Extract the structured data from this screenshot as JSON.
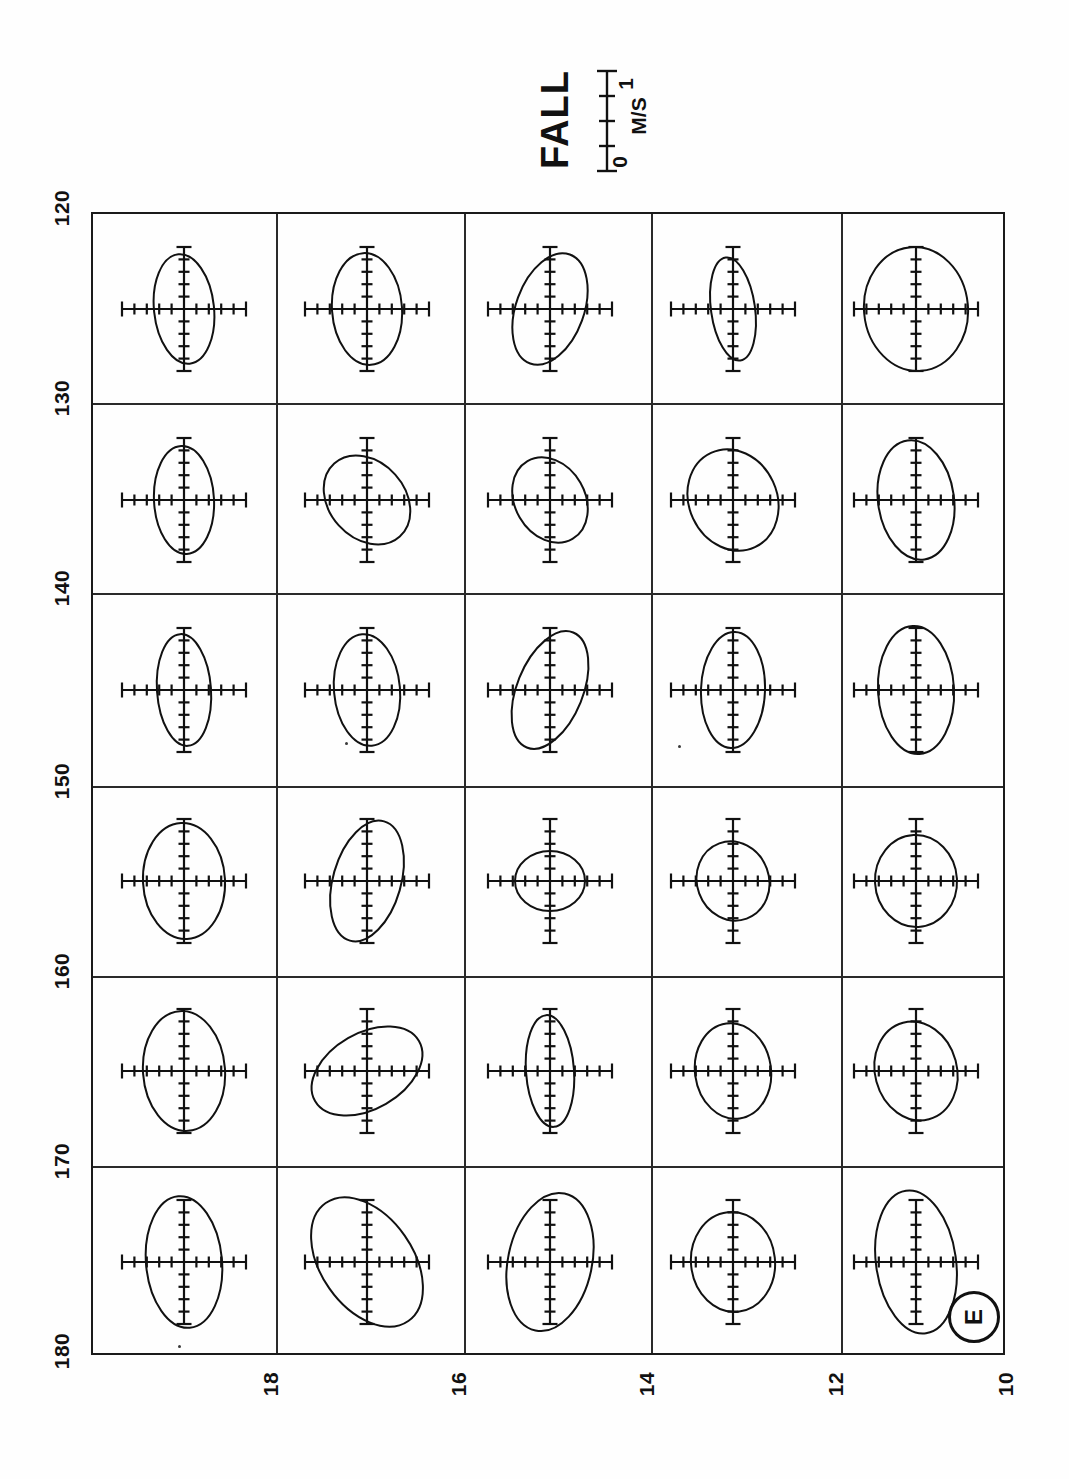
{
  "figure": {
    "title": "FALL",
    "panel_label": "E",
    "type": "tidal-current-ellipse-grid",
    "orientation_note": "page rotated 90 degrees; labels read sideways"
  },
  "scalebar": {
    "name": "velocity-scale",
    "min_label": "0",
    "units_label": "M/S",
    "max_label": "1",
    "min_value": 0,
    "max_value": 1,
    "tick_count": 5
  },
  "axes": {
    "vertical": {
      "name": "longitude-axis",
      "ticks": [
        "120",
        "130",
        "140",
        "150",
        "160",
        "170",
        "180"
      ],
      "values": [
        120,
        130,
        140,
        150,
        160,
        170,
        180
      ]
    },
    "horizontal": {
      "name": "latitude-axis",
      "ticks": [
        "18",
        "16",
        "14",
        "12",
        "10"
      ],
      "values": [
        18,
        16,
        14,
        12,
        10
      ]
    }
  },
  "chart_data": {
    "type": "scatter",
    "title": "FALL",
    "xlabel": "",
    "ylabel": "",
    "grid": true,
    "legend": "none",
    "xlim": [
      120,
      180
    ],
    "ylim": [
      10,
      20
    ],
    "rows": 6,
    "cols": 5,
    "cross_ticks_per_arm": 5,
    "cross_arm_px": 62,
    "ellipses": [
      {
        "row": 0,
        "col": 0,
        "rx": 30,
        "ry": 55,
        "rot": -6
      },
      {
        "row": 0,
        "col": 1,
        "rx": 35,
        "ry": 56,
        "rot": -4
      },
      {
        "row": 0,
        "col": 2,
        "rx": 34,
        "ry": 58,
        "rot": 20
      },
      {
        "row": 0,
        "col": 3,
        "rx": 22,
        "ry": 52,
        "rot": -8
      },
      {
        "row": 0,
        "col": 4,
        "rx": 52,
        "ry": 62,
        "rot": -5
      },
      {
        "row": 1,
        "col": 0,
        "rx": 30,
        "ry": 54,
        "rot": -3
      },
      {
        "row": 1,
        "col": 1,
        "rx": 38,
        "ry": 49,
        "rot": -42
      },
      {
        "row": 1,
        "col": 2,
        "rx": 35,
        "ry": 45,
        "rot": -30
      },
      {
        "row": 1,
        "col": 3,
        "rx": 44,
        "ry": 52,
        "rot": -25
      },
      {
        "row": 1,
        "col": 4,
        "rx": 38,
        "ry": 60,
        "rot": -8
      },
      {
        "row": 2,
        "col": 0,
        "rx": 27,
        "ry": 56,
        "rot": -4
      },
      {
        "row": 2,
        "col": 1,
        "rx": 33,
        "ry": 56,
        "rot": -5
      },
      {
        "row": 2,
        "col": 2,
        "rx": 33,
        "ry": 62,
        "rot": 22
      },
      {
        "row": 2,
        "col": 3,
        "rx": 32,
        "ry": 58,
        "rot": 2
      },
      {
        "row": 2,
        "col": 4,
        "rx": 38,
        "ry": 64,
        "rot": -3
      },
      {
        "row": 3,
        "col": 0,
        "rx": 41,
        "ry": 58,
        "rot": -3
      },
      {
        "row": 3,
        "col": 1,
        "rx": 34,
        "ry": 62,
        "rot": 16
      },
      {
        "row": 3,
        "col": 2,
        "rx": 35,
        "ry": 30,
        "rot": 0
      },
      {
        "row": 3,
        "col": 3,
        "rx": 36,
        "ry": 40,
        "rot": -20
      },
      {
        "row": 3,
        "col": 4,
        "rx": 41,
        "ry": 46,
        "rot": -3
      },
      {
        "row": 4,
        "col": 0,
        "rx": 41,
        "ry": 60,
        "rot": -4
      },
      {
        "row": 4,
        "col": 1,
        "rx": 60,
        "ry": 38,
        "rot": -30
      },
      {
        "row": 4,
        "col": 2,
        "rx": 24,
        "ry": 56,
        "rot": -4
      },
      {
        "row": 4,
        "col": 3,
        "rx": 38,
        "ry": 48,
        "rot": -8
      },
      {
        "row": 4,
        "col": 4,
        "rx": 41,
        "ry": 50,
        "rot": -15
      },
      {
        "row": 5,
        "col": 0,
        "rx": 38,
        "ry": 66,
        "rot": -5
      },
      {
        "row": 5,
        "col": 1,
        "rx": 46,
        "ry": 72,
        "rot": -35
      },
      {
        "row": 5,
        "col": 2,
        "rx": 42,
        "ry": 70,
        "rot": 12
      },
      {
        "row": 5,
        "col": 3,
        "rx": 42,
        "ry": 50,
        "rot": -6
      },
      {
        "row": 5,
        "col": 4,
        "rx": 40,
        "ry": 72,
        "rot": -8
      }
    ]
  }
}
